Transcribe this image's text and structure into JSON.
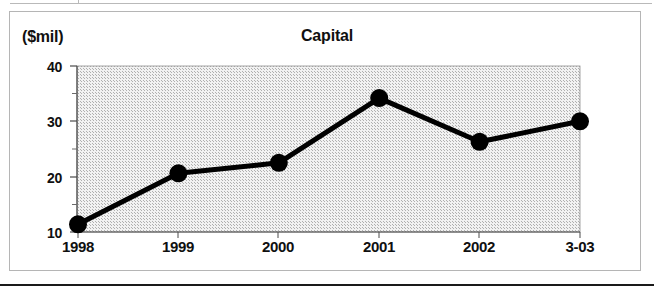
{
  "figure": {
    "units_label": "($mil)",
    "title": "Capital"
  },
  "chart_data": {
    "type": "line",
    "title": "Capital",
    "subtitle": "",
    "xlabel": "",
    "ylabel": "($mil)",
    "units": "$mil",
    "categories": [
      "1998",
      "1999",
      "2000",
      "2001",
      "2002",
      "3-03"
    ],
    "values": [
      11.4,
      20.6,
      22.5,
      34.2,
      26.3,
      30.0
    ],
    "series": [
      {
        "name": "Capital",
        "values": [
          11.4,
          20.6,
          22.5,
          34.2,
          26.3,
          30.0
        ]
      }
    ],
    "ylim": [
      10,
      40
    ],
    "yticks": [
      10,
      20,
      30,
      40
    ],
    "ytick_labels": [
      "10",
      "20",
      "30",
      "40"
    ],
    "yminor_ticks": [
      15,
      25,
      35
    ],
    "xtick_labels": [
      "1998",
      "1999",
      "2000",
      "2001",
      "2002",
      "3-03"
    ],
    "grid": false,
    "legend": "none",
    "marker": "filled-circle",
    "line_color": "#000000",
    "marker_color": "#000000",
    "plot_background": "#e2e2e2",
    "frame_color": "#b5b5b5"
  },
  "axis": {
    "y_labels": [
      "40",
      "30",
      "20",
      "10"
    ],
    "x_labels": [
      "1998",
      "1999",
      "2000",
      "2001",
      "2002",
      "3-03"
    ]
  }
}
